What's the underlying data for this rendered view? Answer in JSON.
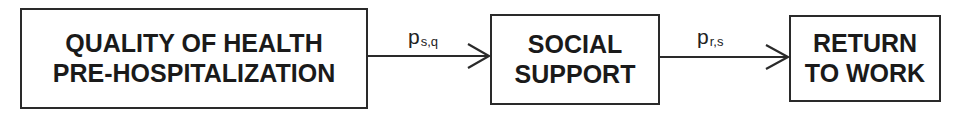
{
  "diagram": {
    "type": "path-diagram",
    "nodes": [
      {
        "id": "quality",
        "lines": [
          "QUALITY OF HEALTH",
          "PRE-HOSPITALIZATION"
        ]
      },
      {
        "id": "social",
        "lines": [
          "SOCIAL",
          "SUPPORT"
        ]
      },
      {
        "id": "return",
        "lines": [
          "RETURN",
          "TO WORK"
        ]
      }
    ],
    "edges": [
      {
        "from": "quality",
        "to": "social",
        "label": {
          "base": "p",
          "sub": "s,q"
        }
      },
      {
        "from": "social",
        "to": "return",
        "label": {
          "base": "p",
          "sub": "r,s"
        }
      }
    ]
  }
}
